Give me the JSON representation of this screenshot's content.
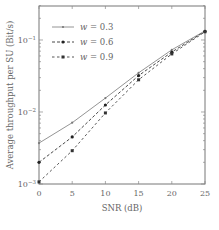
{
  "chart_data": {
    "type": "line",
    "title": "",
    "xlabel": "SNR (dB)",
    "ylabel": "Average throughput per SU (Bit/s)",
    "yscale": "log",
    "xlim": [
      0,
      25
    ],
    "ylim": [
      0.001,
      0.3
    ],
    "grid": false,
    "legend_position": "upper left",
    "x": [
      0,
      5,
      10,
      15,
      20,
      25
    ],
    "x_ticks": [
      "0",
      "5",
      "10",
      "15",
      "20",
      "25"
    ],
    "y_ticks": [
      {
        "value": 0.001,
        "label": "10^-3"
      },
      {
        "value": 0.01,
        "label": "10^-2"
      },
      {
        "value": 0.1,
        "label": "10^-1"
      }
    ],
    "series": [
      {
        "name": "w = 0.3",
        "symbol": "w",
        "value_label": "= 0.3",
        "style": "solid",
        "marker": "dot",
        "color": "#888888",
        "values": [
          0.0037,
          0.0071,
          0.0156,
          0.035,
          0.073,
          0.134
        ]
      },
      {
        "name": "w = 0.6",
        "symbol": "w",
        "value_label": "= 0.6",
        "style": "dashed",
        "marker": "circle",
        "color": "#333333",
        "values": [
          0.002,
          0.0045,
          0.0125,
          0.032,
          0.068,
          0.132
        ]
      },
      {
        "name": "w = 0.9",
        "symbol": "w",
        "value_label": "= 0.9",
        "style": "dashed",
        "marker": "square",
        "color": "#444444",
        "values": [
          0.00107,
          0.0029,
          0.0097,
          0.028,
          0.064,
          0.13
        ]
      }
    ]
  }
}
